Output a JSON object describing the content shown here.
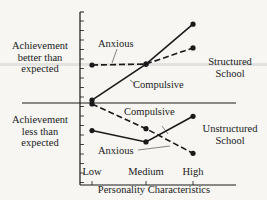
{
  "chart_data": {
    "type": "line",
    "title": "",
    "xlabel": "Personality Characteristics",
    "ylabel": "",
    "categories": [
      "Low",
      "Medium",
      "High"
    ],
    "ylim": [
      -8.5,
      9.5
    ],
    "grid": false,
    "y_region_labels": {
      "top": [
        "Achievement",
        "better than",
        "expected"
      ],
      "bottom": [
        "Achievement",
        "less than",
        "expected"
      ]
    },
    "groups": [
      {
        "name": "Structured School",
        "label_lines": [
          "Structured",
          "School"
        ],
        "series": [
          {
            "name": "Compulsive",
            "style": "solid",
            "values": [
              0.3,
              4.1,
              8.3
            ]
          },
          {
            "name": "Anxious",
            "style": "dashed",
            "values": [
              4.0,
              4.1,
              5.8
            ]
          }
        ]
      },
      {
        "name": "Unstructured School",
        "label_lines": [
          "Unstructured",
          "School"
        ],
        "series": [
          {
            "name": "Compulsive",
            "style": "solid",
            "values": [
              -2.9,
              -4.1,
              -1.4
            ]
          },
          {
            "name": "Anxious",
            "style": "dashed",
            "values": [
              -0.1,
              -2.7,
              -5.3
            ]
          }
        ]
      }
    ],
    "annotations": [
      {
        "text": "Anxious",
        "target": "Structured School / Anxious"
      },
      {
        "text": "Compulsive",
        "target": "Structured School / Compulsive"
      },
      {
        "text": "Compulsive",
        "target": "Unstructured School / Compulsive"
      },
      {
        "text": "Anxious",
        "target": "Unstructured School / Anxious"
      }
    ]
  },
  "labels": {
    "top_region": [
      "Achievement",
      "better than",
      "expected"
    ],
    "bottom_region": [
      "Achievement",
      "less than",
      "expected"
    ],
    "structured": [
      "Structured",
      "School"
    ],
    "unstructured": [
      "Unstructured",
      "School"
    ],
    "x_ticks": [
      "Low",
      "Medium",
      "High"
    ],
    "x_title": "Personality Characteristics",
    "ann_struct_anxious": "Anxious",
    "ann_struct_compulsive": "Compulsive",
    "ann_unstruct_compulsive": "Compulsive",
    "ann_unstruct_anxious": "Anxious"
  },
  "colors": {
    "ink": "#1a1a1a",
    "background": "#f7f6f3",
    "highlight_band": "#d9d9d9"
  }
}
